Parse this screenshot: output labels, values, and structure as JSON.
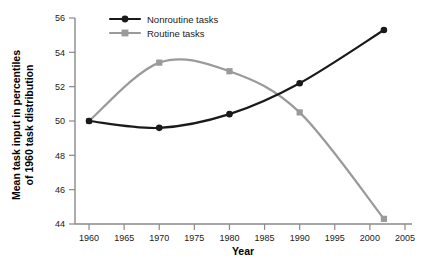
{
  "chart_data": {
    "type": "line",
    "title": "",
    "xlabel": "Year",
    "ylabel": "Mean task input in percentiles of 1960 task distribution",
    "ylabel_line1": "Mean task input in percentiles",
    "ylabel_line2": "of 1960 task distribution",
    "x": [
      1960,
      1970,
      1980,
      1990,
      2002
    ],
    "xlim": [
      1958,
      2006
    ],
    "ylim": [
      44,
      56
    ],
    "xticks": [
      1960,
      1965,
      1970,
      1975,
      1980,
      1985,
      1990,
      1995,
      2000,
      2005
    ],
    "yticks": [
      44,
      46,
      48,
      50,
      52,
      54,
      56
    ],
    "xtick_labels": [
      "1960",
      "1965",
      "1970",
      "1975",
      "1980",
      "1985",
      "1990",
      "1995",
      "2000",
      "2005"
    ],
    "ytick_labels": [
      "44",
      "46",
      "48",
      "50",
      "52",
      "54",
      "56"
    ],
    "grid": false,
    "legend_position": "top-center",
    "series": [
      {
        "name": "Nonroutine tasks",
        "color": "#1a1a1a",
        "marker": "circle",
        "values": [
          50.0,
          49.6,
          50.4,
          52.2,
          55.3
        ]
      },
      {
        "name": "Routine tasks",
        "color": "#9a9a9a",
        "marker": "square",
        "values": [
          50.0,
          53.4,
          52.9,
          50.5,
          44.3
        ]
      }
    ]
  },
  "legend": {
    "entries": [
      {
        "label": "Nonroutine tasks"
      },
      {
        "label": "Routine tasks"
      }
    ]
  },
  "colors": {
    "nonroutine": "#1a1a1a",
    "routine": "#9a9a9a",
    "axis": "#8a8a8a",
    "text": "#1a1a1a",
    "background": "#ffffff"
  }
}
